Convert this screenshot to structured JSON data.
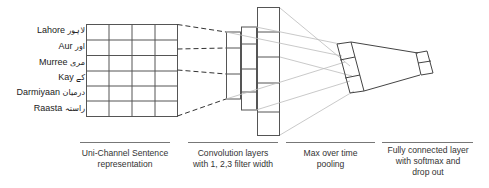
{
  "words": [
    {
      "english": "Lahore",
      "urdu": "لاہور"
    },
    {
      "english": "Aur",
      "urdu": "اور"
    },
    {
      "english": "Murree",
      "urdu": "مری"
    },
    {
      "english": "Kay",
      "urdu": "کے"
    },
    {
      "english": "Darmiyaan",
      "urdu": "درمیان"
    },
    {
      "english": "Raasta",
      "urdu": "راستہ"
    }
  ],
  "captions": {
    "input": {
      "line1": "Uni-Channel Sentence",
      "line2": "representation"
    },
    "conv": {
      "line1": "Convolution layers",
      "line2": "with 1, 2,3 filter width"
    },
    "pool": {
      "line1": "Max over time",
      "line2": "pooling"
    },
    "fc": {
      "line1": "Fully connected layer",
      "line2": "with softmax and",
      "line3": "drop out"
    }
  },
  "colors": {
    "line": "#555555",
    "dashed": "#333333",
    "light_connector": "#bbbbbb"
  },
  "grid": {
    "rows": 6,
    "cols": 4
  }
}
